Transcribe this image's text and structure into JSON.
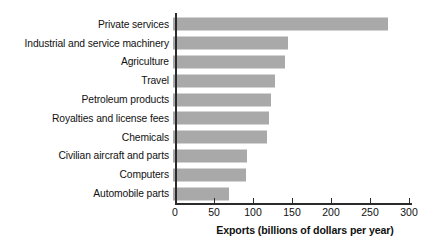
{
  "chart_data": {
    "type": "bar",
    "orientation": "horizontal",
    "title": "",
    "xlabel": "Exports (billions of dollars per year)",
    "ylabel": "",
    "xlim": [
      0,
      300
    ],
    "xticks": [
      0,
      50,
      100,
      150,
      200,
      250,
      300
    ],
    "xtick_labels": [
      "0",
      "50",
      "100",
      "150",
      "200",
      "250",
      "300"
    ],
    "grid": false,
    "legend": null,
    "bar_color": "#a9a9a9",
    "axis_color": "#2b2b2b",
    "categories": [
      "Private services",
      "Industrial and service machinery",
      "Agriculture",
      "Travel",
      "Petroleum products",
      "Royalties and license fees",
      "Chemicals",
      "Civilian aircraft and parts",
      "Computers",
      "Automobile parts"
    ],
    "values": [
      275,
      147,
      144,
      131,
      125,
      123,
      120,
      95,
      93,
      72
    ]
  }
}
